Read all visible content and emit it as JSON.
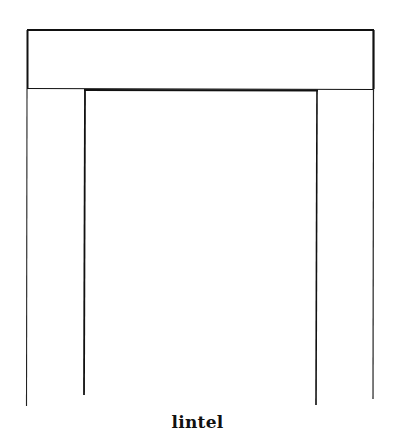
{
  "diagram": {
    "caption": "lintel",
    "stroke_color": "#111111",
    "background": "#ffffff",
    "parts": [
      {
        "name": "lintel-beam",
        "type": "rect",
        "x1": 27,
        "y1": 30,
        "x2": 374,
        "y2": 89
      },
      {
        "name": "left-jamb-outer",
        "type": "line",
        "x": 27,
        "y1": 89,
        "y2": 406
      },
      {
        "name": "left-jamb-inner",
        "type": "line",
        "x": 85,
        "y1": 89,
        "y2": 395
      },
      {
        "name": "right-jamb-inner",
        "type": "line",
        "x": 317,
        "y1": 90,
        "y2": 405
      },
      {
        "name": "right-jamb-outer",
        "type": "line",
        "x": 373,
        "y1": 89,
        "y2": 399
      },
      {
        "name": "opening-head",
        "type": "line",
        "x1": 85,
        "x2": 317,
        "y": 90
      }
    ]
  }
}
